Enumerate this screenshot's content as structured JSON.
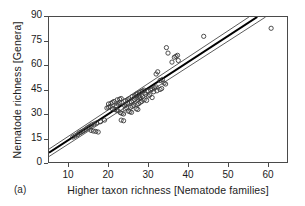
{
  "figure": {
    "panel_letter": "(a)",
    "xlabel": "Higher taxon richness [Nematode families]",
    "ylabel": "Nematode richness [Genera]"
  },
  "chart_data": {
    "type": "scatter",
    "title": "",
    "xlabel": "Higher taxon richness [Nematode families]",
    "ylabel": "Nematode richness [Genera]",
    "xlim": [
      5,
      65
    ],
    "ylim": [
      0,
      90
    ],
    "xticks": [
      10,
      20,
      30,
      40,
      50,
      60
    ],
    "yticks": [
      0,
      15,
      30,
      45,
      60,
      75,
      90
    ],
    "grid": false,
    "legend": null,
    "marker": "open-circle",
    "marker_color": "#3a3a3a",
    "points": [
      [
        11.0,
        15.5
      ],
      [
        11.6,
        16.2
      ],
      [
        12.2,
        17.0
      ],
      [
        12.6,
        18.0
      ],
      [
        13.0,
        18.4
      ],
      [
        13.4,
        19.0
      ],
      [
        13.8,
        19.6
      ],
      [
        14.2,
        20.2
      ],
      [
        14.6,
        21.0
      ],
      [
        15.0,
        21.6
      ],
      [
        15.4,
        22.2
      ],
      [
        15.6,
        19.6
      ],
      [
        16.2,
        19.2
      ],
      [
        16.8,
        19.0
      ],
      [
        17.4,
        18.6
      ],
      [
        15.8,
        23.0
      ],
      [
        16.4,
        23.6
      ],
      [
        17.0,
        24.2
      ],
      [
        18.0,
        25.0
      ],
      [
        19.0,
        26.0
      ],
      [
        19.6,
        33.5
      ],
      [
        20.0,
        34.0
      ],
      [
        20.4,
        34.4
      ],
      [
        20.0,
        36.0
      ],
      [
        20.6,
        36.4
      ],
      [
        21.0,
        37.0
      ],
      [
        21.4,
        37.6
      ],
      [
        21.0,
        33.0
      ],
      [
        21.6,
        32.6
      ],
      [
        22.0,
        32.2
      ],
      [
        22.4,
        31.8
      ],
      [
        22.0,
        35.0
      ],
      [
        22.4,
        36.0
      ],
      [
        22.8,
        37.0
      ],
      [
        22.2,
        38.6
      ],
      [
        22.8,
        39.0
      ],
      [
        23.2,
        39.4
      ],
      [
        23.0,
        30.6
      ],
      [
        23.4,
        30.2
      ],
      [
        23.8,
        29.8
      ],
      [
        23.2,
        26.0
      ],
      [
        23.8,
        25.6
      ],
      [
        24.2,
        33.0
      ],
      [
        24.6,
        33.6
      ],
      [
        24.0,
        35.2
      ],
      [
        24.4,
        36.0
      ],
      [
        24.8,
        36.6
      ],
      [
        24.2,
        38.0
      ],
      [
        24.8,
        38.6
      ],
      [
        25.2,
        39.2
      ],
      [
        25.0,
        31.6
      ],
      [
        25.4,
        31.2
      ],
      [
        25.8,
        30.8
      ],
      [
        25.6,
        34.0
      ],
      [
        26.0,
        34.6
      ],
      [
        26.4,
        35.2
      ],
      [
        25.8,
        37.4
      ],
      [
        26.2,
        38.0
      ],
      [
        26.6,
        38.6
      ],
      [
        26.0,
        40.6
      ],
      [
        26.6,
        41.2
      ],
      [
        27.0,
        41.8
      ],
      [
        27.0,
        33.0
      ],
      [
        27.4,
        32.6
      ],
      [
        27.2,
        35.6
      ],
      [
        27.6,
        36.2
      ],
      [
        27.4,
        39.0
      ],
      [
        27.8,
        39.6
      ],
      [
        27.2,
        42.4
      ],
      [
        27.8,
        43.0
      ],
      [
        28.2,
        43.6
      ],
      [
        28.0,
        37.0
      ],
      [
        28.4,
        37.6
      ],
      [
        28.0,
        40.0
      ],
      [
        28.6,
        40.6
      ],
      [
        28.6,
        44.0
      ],
      [
        29.0,
        44.6
      ],
      [
        29.4,
        42.0
      ],
      [
        29.0,
        38.6
      ],
      [
        29.6,
        38.2
      ],
      [
        30.0,
        41.0
      ],
      [
        30.4,
        41.6
      ],
      [
        30.0,
        44.0
      ],
      [
        30.6,
        44.6
      ],
      [
        31.0,
        45.2
      ],
      [
        31.4,
        43.6
      ],
      [
        31.0,
        40.0
      ],
      [
        31.6,
        46.0
      ],
      [
        32.0,
        46.6
      ],
      [
        32.2,
        44.2
      ],
      [
        32.0,
        54.6
      ],
      [
        32.4,
        56.0
      ],
      [
        33.0,
        45.0
      ],
      [
        33.4,
        45.6
      ],
      [
        33.0,
        50.6
      ],
      [
        33.6,
        51.2
      ],
      [
        34.0,
        49.0
      ],
      [
        34.4,
        48.4
      ],
      [
        34.6,
        71.0
      ],
      [
        35.0,
        67.6
      ],
      [
        36.0,
        62.0
      ],
      [
        36.6,
        65.0
      ],
      [
        37.0,
        65.6
      ],
      [
        37.4,
        66.2
      ],
      [
        37.6,
        63.0
      ],
      [
        44.0,
        78.0
      ],
      [
        61.0,
        83.0
      ]
    ],
    "fit_line": {
      "name": "regression-line",
      "x": [
        5.0,
        57.5
      ],
      "y": [
        5.8,
        90.0
      ],
      "color": "#000000",
      "width": 2.1
    },
    "confidence_bands": [
      {
        "name": "upper-confidence-band",
        "x": [
          5.0,
          55.4
        ],
        "y": [
          8.0,
          90.0
        ],
        "color": "#5a5a5a",
        "width": 1.0
      },
      {
        "name": "lower-confidence-band",
        "x": [
          5.0,
          59.6
        ],
        "y": [
          3.4,
          90.0
        ],
        "color": "#5a5a5a",
        "width": 1.0
      }
    ]
  }
}
